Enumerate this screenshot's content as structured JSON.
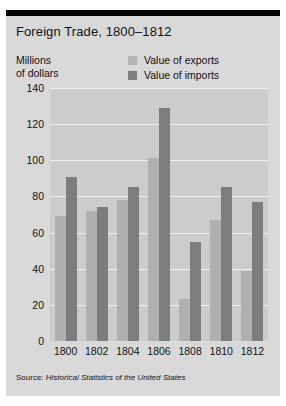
{
  "chart_data": {
    "type": "bar",
    "title": "Foreign Trade, 1800–1812",
    "xlabel": "",
    "ylabel": "Millions of dollars",
    "ylabel_line1": "Millions",
    "ylabel_line2": "of dollars",
    "categories": [
      "1800",
      "1802",
      "1804",
      "1806",
      "1808",
      "1810",
      "1812"
    ],
    "series": [
      {
        "name": "Value of exports",
        "color": "#b0b0b0",
        "values": [
          69,
          72,
          78,
          101,
          23,
          67,
          39
        ]
      },
      {
        "name": "Value of imports",
        "color": "#7d7d7d",
        "values": [
          91,
          74,
          85,
          129,
          55,
          85,
          77
        ]
      }
    ],
    "yticks": [
      140,
      120,
      100,
      80,
      60,
      40,
      20,
      0
    ],
    "ylim": [
      0,
      140
    ],
    "grid": true,
    "legend_position": "top-right",
    "source": "Source: Historical Statistics of the United States",
    "source_prefix": "Source: ",
    "source_title": "Historical Statistics of the United States"
  },
  "legend": {
    "items": [
      {
        "label": "Value of exports"
      },
      {
        "label": "Value of imports"
      }
    ]
  },
  "colors": {
    "exports": "#b0b0b0",
    "imports": "#7d7d7d",
    "panel_background": "#d9d9d9",
    "plot_background": "#cccccc",
    "gridline": "#f0f0f0",
    "rule": "#000000"
  }
}
